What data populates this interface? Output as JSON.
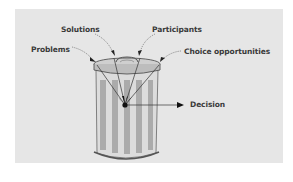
{
  "diagram": {
    "labels": {
      "solutions": "Solutions",
      "participants": "Participants",
      "problems": "Problems",
      "choice_opportunities": "Choice opportunities",
      "decision": "Decision"
    },
    "colors": {
      "panel_bg": "#e6e6e6",
      "can_stripe_dark": "#a8a8a8",
      "can_stripe_light": "#d2d2d2",
      "outline": "#555555",
      "text": "#3a3a3a"
    }
  }
}
